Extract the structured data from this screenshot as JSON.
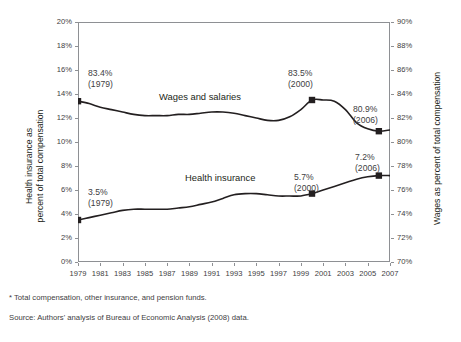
{
  "top_crop_text": "",
  "axes": {
    "left_title_line1": "Health insurance as",
    "left_title_line2": "percent of total compensation",
    "right_title": "Wages as percent of total compensation"
  },
  "footnotes": {
    "note": "* Total compensation, other insurance, and pension funds.",
    "source": "Source: Authors' analysis of Bureau of Economic Analysis (2008) data."
  },
  "series_labels": {
    "wages": "Wages and salaries",
    "health": "Health insurance"
  },
  "annotations": {
    "wages_1979_value": "83.4%",
    "wages_1979_year": "(1979)",
    "wages_2000_value": "83.5%",
    "wages_2000_year": "(2000)",
    "wages_2006_value": "80.9%",
    "wages_2006_year": "(2006)",
    "health_1979_value": "3.5%",
    "health_1979_year": "(1979)",
    "health_2000_value": "5.7%",
    "health_2000_year": "(2000)",
    "health_2006_value": "7.2%",
    "health_2006_year": "(2006)"
  },
  "chart_data": {
    "type": "line",
    "title": "",
    "xlabel": "",
    "ylabel": "Health insurance as percent of total compensation",
    "y2label": "Wages as percent of total compensation",
    "grid": false,
    "legend": "inline-labels",
    "x": [
      1979,
      1980,
      1981,
      1982,
      1983,
      1984,
      1985,
      1986,
      1987,
      1988,
      1989,
      1990,
      1991,
      1992,
      1993,
      1994,
      1995,
      1996,
      1997,
      1998,
      1999,
      2000,
      2001,
      2002,
      2003,
      2004,
      2005,
      2006,
      2007
    ],
    "xlim": [
      1979,
      2007
    ],
    "xticks": [
      1979,
      1981,
      1983,
      1985,
      1987,
      1989,
      1991,
      1993,
      1995,
      1997,
      1999,
      2001,
      2003,
      2005,
      2007
    ],
    "xticklabels": [
      "1979",
      "1981",
      "1983",
      "1985",
      "1987",
      "1989",
      "1991",
      "1993",
      "1995",
      "1997",
      "1999",
      "2001",
      "2003",
      "2005",
      "2007"
    ],
    "ylim": [
      0,
      20
    ],
    "yticks": [
      0,
      2,
      4,
      6,
      8,
      10,
      12,
      14,
      16,
      18,
      20
    ],
    "yticklabels": [
      "0%",
      "2%",
      "4%",
      "6%",
      "8%",
      "10%",
      "12%",
      "14%",
      "16%",
      "18%",
      "20%"
    ],
    "y2lim": [
      70,
      90
    ],
    "y2ticks": [
      70,
      72,
      74,
      76,
      78,
      80,
      82,
      84,
      86,
      88,
      90
    ],
    "y2ticklabels": [
      "70%",
      "72%",
      "74%",
      "76%",
      "78%",
      "80%",
      "82%",
      "84%",
      "86%",
      "88%",
      "90%"
    ],
    "series": [
      {
        "name": "Wages and salaries",
        "axis": "right",
        "color": "#231f20",
        "values": [
          83.4,
          83.2,
          82.9,
          82.7,
          82.5,
          82.3,
          82.2,
          82.2,
          82.2,
          82.3,
          82.3,
          82.4,
          82.5,
          82.5,
          82.4,
          82.2,
          82.0,
          81.8,
          81.8,
          82.1,
          82.7,
          83.5,
          83.5,
          83.4,
          82.7,
          81.6,
          81.1,
          80.9,
          81.0
        ],
        "markers": [
          {
            "x": 1979,
            "y": 83.4,
            "label": "83.4%",
            "sublabel": "(1979)"
          },
          {
            "x": 2000,
            "y": 83.5,
            "label": "83.5%",
            "sublabel": "(2000)"
          },
          {
            "x": 2006,
            "y": 80.9,
            "label": "80.9%",
            "sublabel": "(2006)"
          }
        ]
      },
      {
        "name": "Health insurance",
        "axis": "left",
        "color": "#231f20",
        "values": [
          3.5,
          3.7,
          3.9,
          4.1,
          4.3,
          4.4,
          4.4,
          4.4,
          4.4,
          4.5,
          4.6,
          4.8,
          5.0,
          5.3,
          5.6,
          5.7,
          5.7,
          5.6,
          5.5,
          5.5,
          5.5,
          5.7,
          6.0,
          6.3,
          6.6,
          6.9,
          7.1,
          7.2,
          7.2
        ],
        "markers": [
          {
            "x": 1979,
            "y": 3.5,
            "label": "3.5%",
            "sublabel": "(1979)"
          },
          {
            "x": 2000,
            "y": 5.7,
            "label": "5.7%",
            "sublabel": "(2000)"
          },
          {
            "x": 2006,
            "y": 7.2,
            "label": "7.2%",
            "sublabel": "(2006)"
          }
        ]
      }
    ]
  }
}
